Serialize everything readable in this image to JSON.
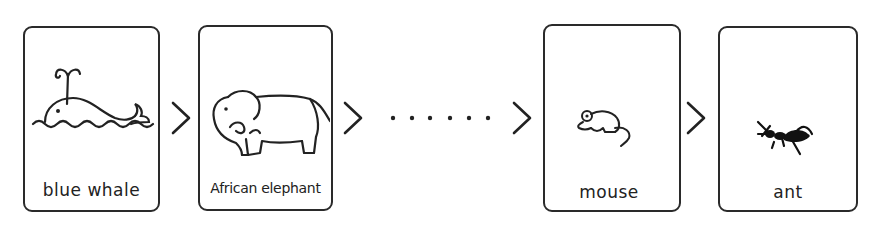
{
  "diagram": {
    "cards": [
      {
        "label": "blue whale",
        "icon": "whale-icon"
      },
      {
        "label": "African elephant",
        "icon": "elephant-icon"
      },
      {
        "label": "mouse",
        "icon": "mouse-icon"
      },
      {
        "label": "ant",
        "icon": "ant-icon"
      }
    ],
    "connector": ">",
    "ellipsis": "......",
    "line_color": "#2a2a2a"
  }
}
